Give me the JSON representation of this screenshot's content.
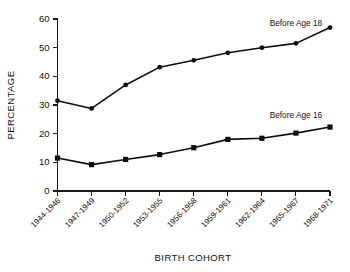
{
  "chart_data": {
    "type": "line",
    "title": "",
    "xlabel": "BIRTH COHORT",
    "ylabel": "PERCENTAGE",
    "ylim": [
      0,
      60
    ],
    "yticks": [
      0,
      10,
      20,
      30,
      40,
      50,
      60
    ],
    "grid": false,
    "legend_position": "inline-annotation",
    "categories": [
      "1944-1946",
      "1947-1949",
      "1950-1952",
      "1953-1955",
      "1956-1958",
      "1959-1961",
      "1962-1964",
      "1965-1967",
      "1968-1971"
    ],
    "series": [
      {
        "name": "Before Age 18",
        "marker": "circle",
        "values": [
          31.5,
          28.8,
          37.0,
          43.2,
          45.6,
          48.2,
          50.0,
          51.5,
          57.0
        ]
      },
      {
        "name": "Before Age 16",
        "marker": "square",
        "values": [
          11.5,
          9.2,
          11.0,
          12.7,
          15.1,
          18.0,
          18.4,
          20.2,
          22.3
        ]
      }
    ],
    "annotations": [
      {
        "text": "Before Age 18",
        "x_category": "1965-1967",
        "y_value": 57.5
      },
      {
        "text": "Before Age 16",
        "x_category": "1965-1967",
        "y_value": 25.5
      }
    ],
    "colors": {
      "line": "#0d0d0d",
      "axis": "#1a1a1a",
      "text": "#111111",
      "background": "#ffffff"
    }
  }
}
